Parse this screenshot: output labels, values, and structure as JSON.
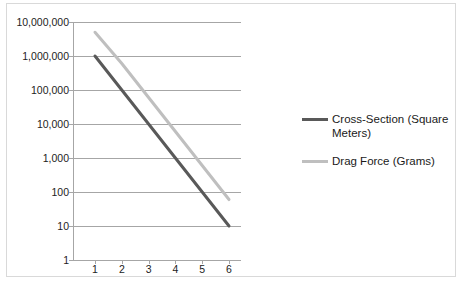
{
  "chart_data": {
    "type": "line",
    "title": "",
    "xlabel": "",
    "ylabel": "",
    "x": [
      1,
      2,
      3,
      4,
      5,
      6
    ],
    "xtick_labels": [
      "1",
      "2",
      "3",
      "4",
      "5",
      "6"
    ],
    "yscale": "log",
    "ylim": [
      1,
      10000000
    ],
    "ytick_labels": [
      "1",
      "10",
      "100",
      "1,000",
      "10,000",
      "100,000",
      "1,000,000",
      "10,000,000"
    ],
    "ytick_values": [
      1,
      10,
      100,
      1000,
      10000,
      100000,
      1000000,
      10000000
    ],
    "grid": "horizontal",
    "legend_position": "right",
    "series": [
      {
        "name": "Cross-Section (Square Meters)",
        "color": "#595959",
        "values": [
          1000000,
          100000,
          10000,
          1000,
          100,
          10
        ]
      },
      {
        "name": "Drag Force (Grams)",
        "color": "#bfbfbf",
        "values": [
          5000000,
          600000,
          60000,
          6000,
          600,
          60
        ]
      }
    ]
  },
  "legend": {
    "items": [
      {
        "label": "Cross-Section (Square Meters)",
        "color": "#595959"
      },
      {
        "label": "Drag Force (Grams)",
        "color": "#bfbfbf"
      }
    ]
  },
  "caption": {
    "text": ""
  }
}
